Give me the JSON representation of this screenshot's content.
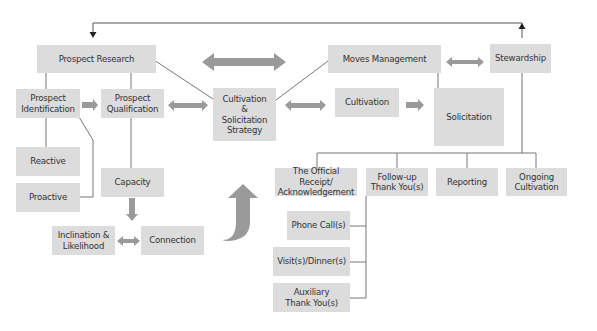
{
  "colors": {
    "box_fill": "#dcdcdc",
    "box_text": "#333333",
    "line": "#555555",
    "arrow_fill": "#9a9a9a",
    "background": "#ffffff"
  },
  "nodes": {
    "prospect_research": {
      "label": "Prospect Research"
    },
    "prospect_identification": {
      "label": "Prospect\nIdentification"
    },
    "prospect_qualification": {
      "label": "Prospect\nQualification"
    },
    "cultivation_solicitation_strategy": {
      "label": "Cultivation\n&\nSolicitation\nStrategy"
    },
    "moves_management": {
      "label": "Moves Management"
    },
    "stewardship": {
      "label": "Stewardship"
    },
    "cultivation": {
      "label": "Cultivation"
    },
    "solicitation": {
      "label": "Solicitation"
    },
    "reactive": {
      "label": "Reactive"
    },
    "proactive": {
      "label": "Proactive"
    },
    "capacity": {
      "label": "Capacity"
    },
    "inclination_likelihood": {
      "label": "Inclination &\nLikelihood"
    },
    "connection": {
      "label": "Connection"
    },
    "official_receipt": {
      "label": "The Official Receipt/\nAcknowledgement"
    },
    "follow_up": {
      "label": "Follow-up\nThank You(s)"
    },
    "reporting": {
      "label": "Reporting"
    },
    "ongoing_cultivation": {
      "label": "Ongoing\nCultivation"
    },
    "phone_calls": {
      "label": "Phone Call(s)"
    },
    "visits_dinners": {
      "label": "Visit(s)/Dinner(s)"
    },
    "auxiliary_thank_yous": {
      "label": "Auxiliary\nThank You(s)"
    }
  },
  "edges": [
    {
      "from": "stewardship",
      "to": "prospect_research",
      "type": "feedback-loop-arrow"
    },
    {
      "from": "prospect_research",
      "to": "prospect_identification",
      "type": "line"
    },
    {
      "from": "prospect_research",
      "to": "prospect_qualification",
      "type": "line"
    },
    {
      "from": "prospect_research",
      "to": "cultivation_solicitation_strategy",
      "type": "line"
    },
    {
      "from": "prospect_identification",
      "to": "prospect_qualification",
      "type": "block-arrow"
    },
    {
      "from": "prospect_qualification",
      "to": "cultivation_solicitation_strategy",
      "type": "double-block-arrow"
    },
    {
      "from": "prospect_identification",
      "to": "reactive",
      "type": "line"
    },
    {
      "from": "prospect_identification",
      "to": "proactive",
      "type": "line"
    },
    {
      "from": "prospect_qualification",
      "to": "capacity",
      "type": "line"
    },
    {
      "from": "capacity",
      "to": "connection",
      "type": "block-arrow"
    },
    {
      "from": "inclination_likelihood",
      "to": "connection",
      "type": "double-block-arrow"
    },
    {
      "from": "cultivation_solicitation_strategy",
      "to": "moves_management",
      "type": "line"
    },
    {
      "from": "cultivation_solicitation_strategy",
      "to": "cultivation",
      "type": "double-block-arrow"
    },
    {
      "from": "cultivation",
      "to": "solicitation",
      "type": "block-arrow"
    },
    {
      "from": "moves_management",
      "to": "solicitation",
      "type": "line"
    },
    {
      "from": "moves_management",
      "to": "stewardship",
      "type": "double-block-arrow"
    },
    {
      "from": "prospect_research",
      "to": "moves_management",
      "type": "large-double-block-arrow"
    },
    {
      "from": "stewardship",
      "to": "official_receipt",
      "type": "line"
    },
    {
      "from": "stewardship",
      "to": "follow_up",
      "type": "line"
    },
    {
      "from": "stewardship",
      "to": "reporting",
      "type": "line"
    },
    {
      "from": "stewardship",
      "to": "ongoing_cultivation",
      "type": "line"
    },
    {
      "from": "follow_up",
      "to": "phone_calls",
      "type": "line"
    },
    {
      "from": "follow_up",
      "to": "visits_dinners",
      "type": "line"
    },
    {
      "from": "follow_up",
      "to": "auxiliary_thank_yous",
      "type": "line"
    },
    {
      "from": "connection",
      "to": "official_receipt",
      "type": "curved-up-arrow"
    }
  ]
}
